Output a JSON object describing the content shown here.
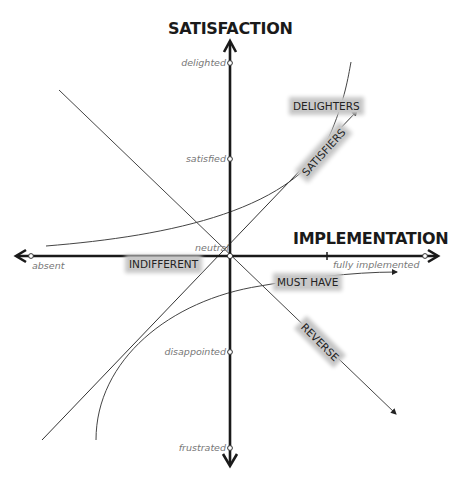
{
  "diagram": {
    "title_y_axis": "SATISFACTION",
    "title_x_axis": "IMPLEMENTATION",
    "y_ticks": {
      "delighted": "delighted",
      "satisfied": "satisfied",
      "neutral": "neutral",
      "disappointed": "disappointed",
      "frustrated": "frustrated"
    },
    "x_ticks": {
      "absent": "absent",
      "fully_implemented": "fully implemented"
    },
    "categories": {
      "delighters": "DELIGHTERS",
      "satisfiers": "SATISFIERS",
      "indifferent": "INDIFFERENT",
      "must_have": "MUST HAVE",
      "reverse": "REVERSE"
    },
    "colors": {
      "axis": "#1a1a1a",
      "curve": "#333333",
      "label_bg": "#c8c8c8",
      "tick_text": "#777777"
    }
  }
}
